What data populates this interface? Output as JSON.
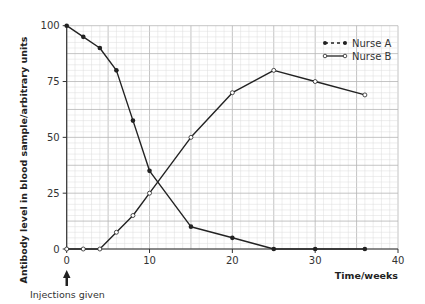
{
  "chart_data": {
    "type": "line",
    "title": "",
    "xlabel": "Time/weeks",
    "ylabel": "Antibody level in blood sample/arbitrary units",
    "xlim": [
      0,
      40
    ],
    "ylim": [
      0,
      100
    ],
    "x_ticks": [
      "0",
      "10",
      "20",
      "30",
      "40"
    ],
    "y_ticks": [
      "0",
      "25",
      "50",
      "75",
      "100"
    ],
    "grid": true,
    "legend_position": "top-right",
    "series": [
      {
        "name": "Nurse A",
        "marker": "filled-circle",
        "x": [
          0,
          2,
          4,
          6,
          8,
          10,
          15,
          20,
          25,
          30,
          36
        ],
        "values": [
          100,
          95,
          90,
          80,
          57.5,
          35,
          10,
          5,
          0,
          0,
          0
        ]
      },
      {
        "name": "Nurse B",
        "marker": "open-circle",
        "x": [
          0,
          2,
          4,
          6,
          8,
          10,
          15,
          20,
          25,
          30,
          36
        ],
        "values": [
          0,
          0,
          0,
          7.5,
          15,
          25,
          50,
          70,
          80,
          75,
          69
        ]
      }
    ],
    "annotations": [
      {
        "text": "Injections given",
        "x": 0,
        "type": "arrow-up"
      }
    ]
  },
  "legend": {
    "items": [
      {
        "label": "Nurse A",
        "marker": "filled-circle",
        "line": "dashed"
      },
      {
        "label": "Nurse B",
        "marker": "open-circle",
        "line": "solid"
      }
    ]
  },
  "axis": {
    "x_title": "Time/weeks",
    "y_title": "Antibody level in blood sample/arbitrary units"
  },
  "annotation": {
    "label": "Injections given"
  },
  "colors": {
    "line": "#222222",
    "grid_minor": "#dddddd",
    "grid_major": "#b5b5b5",
    "axis": "#333333"
  }
}
